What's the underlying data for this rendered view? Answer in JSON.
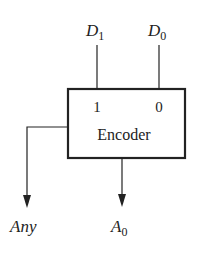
{
  "diagram": {
    "block": {
      "label": "Encoder",
      "input_pins": [
        "1",
        "0"
      ]
    },
    "inputs": [
      {
        "name": "D",
        "subscript": "1"
      },
      {
        "name": "D",
        "subscript": "0"
      }
    ],
    "outputs": [
      {
        "name": "Any",
        "subscript": ""
      },
      {
        "name": "A",
        "subscript": "0"
      }
    ],
    "colors": {
      "stroke": "#222222",
      "background": "#ffffff"
    }
  }
}
